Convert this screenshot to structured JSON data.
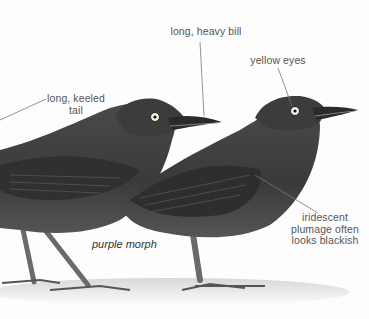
{
  "annotations": {
    "bill": "long, heavy bill",
    "eyes": "yellow eyes",
    "tail_line1": "long, keeled",
    "tail_line2": "tail",
    "plumage_line1": "iridescent",
    "plumage_line2": "plumage often",
    "plumage_line3": "looks blackish"
  },
  "caption": "purple morph",
  "colors": {
    "background": "#fdfdfd",
    "plumage": "#3a3a3a",
    "eye": "#f0f0e0",
    "leader_line": "#777777"
  }
}
